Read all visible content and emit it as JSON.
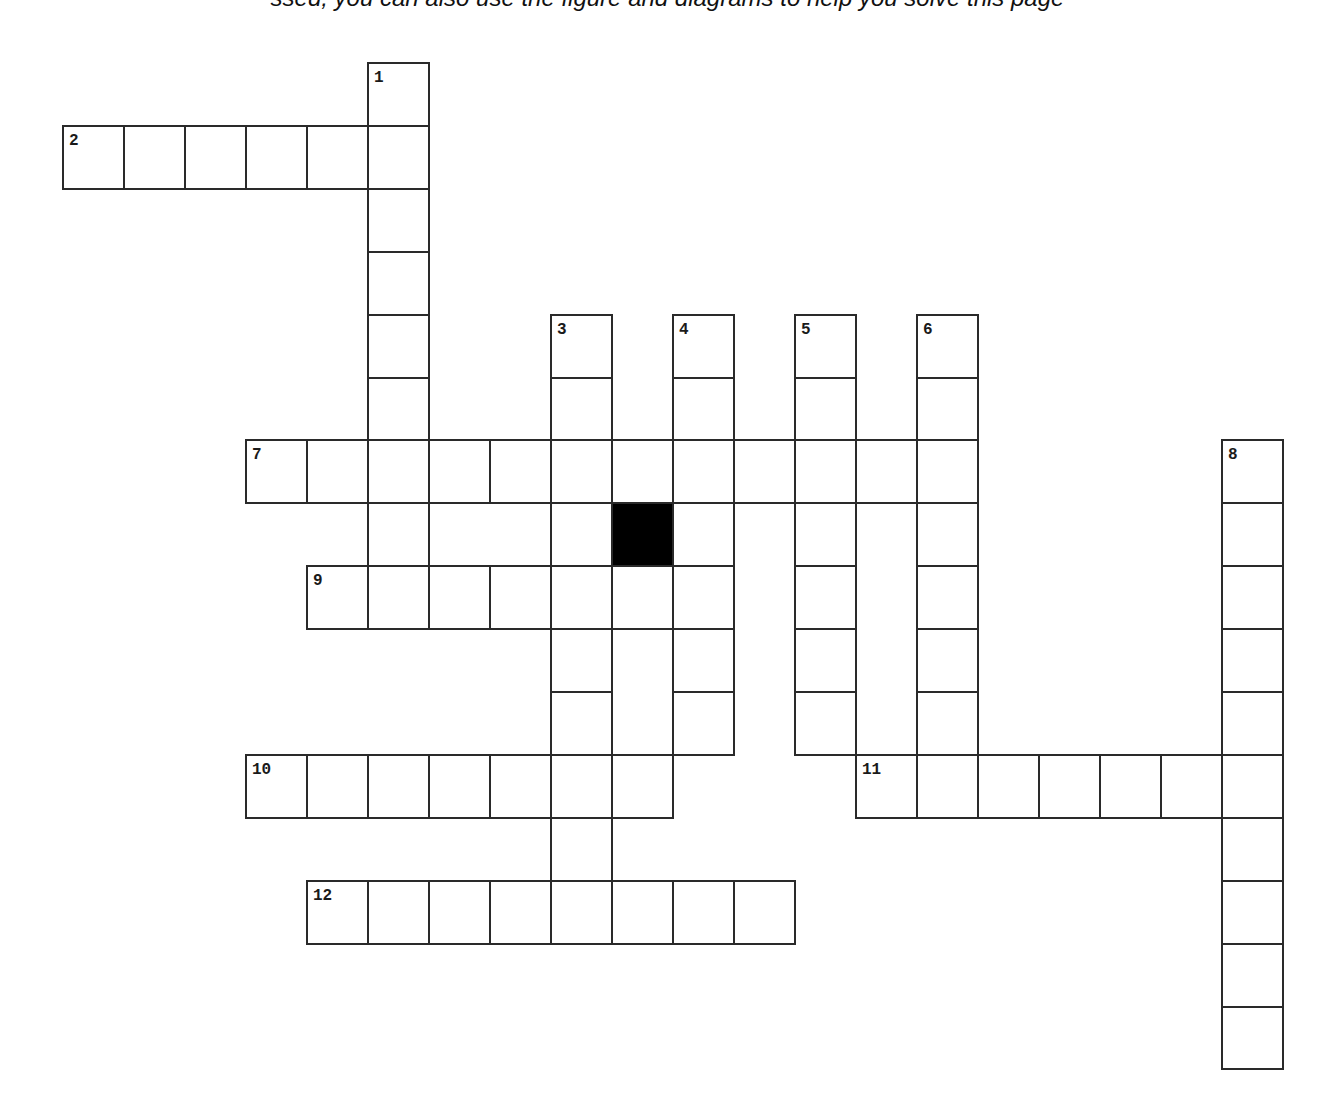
{
  "caption": "ssed, you can also use the figure and diagrams to help you solve this page",
  "grid": {
    "origin_x": 63,
    "origin_y": 63,
    "cell_w": 61,
    "cell_h": 62.9,
    "line_color": "#2a2a2a",
    "black_color": "#000000"
  },
  "words": [
    {
      "number": "1",
      "direction": "down",
      "row": 0,
      "col": 5,
      "length": 9
    },
    {
      "number": "2",
      "direction": "across",
      "row": 1,
      "col": 0,
      "length": 6
    },
    {
      "number": "3",
      "direction": "down",
      "row": 4,
      "col": 8,
      "length": 10
    },
    {
      "number": "4",
      "direction": "down",
      "row": 4,
      "col": 10,
      "length": 7
    },
    {
      "number": "5",
      "direction": "down",
      "row": 4,
      "col": 12,
      "length": 7
    },
    {
      "number": "6",
      "direction": "down",
      "row": 4,
      "col": 14,
      "length": 8
    },
    {
      "number": "7",
      "direction": "across",
      "row": 6,
      "col": 3,
      "length": 12
    },
    {
      "number": "8",
      "direction": "down",
      "row": 6,
      "col": 19,
      "length": 10
    },
    {
      "number": "9",
      "direction": "across",
      "row": 8,
      "col": 4,
      "length": 7
    },
    {
      "number": "10",
      "direction": "across",
      "row": 11,
      "col": 3,
      "length": 7
    },
    {
      "number": "11",
      "direction": "across",
      "row": 11,
      "col": 13,
      "length": 7
    },
    {
      "number": "12",
      "direction": "across",
      "row": 13,
      "col": 4,
      "length": 8
    }
  ],
  "black_cells": [
    {
      "row": 7,
      "col": 9
    }
  ]
}
